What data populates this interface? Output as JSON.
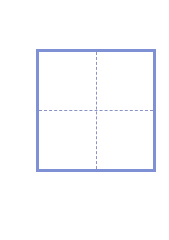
{
  "icon": {
    "name": "grid-quadrant-icon",
    "border_color": "#7f90d4",
    "dash_color": "#8a93c4",
    "divisions": {
      "rows": 2,
      "columns": 2
    },
    "divider_style": "dashed"
  }
}
